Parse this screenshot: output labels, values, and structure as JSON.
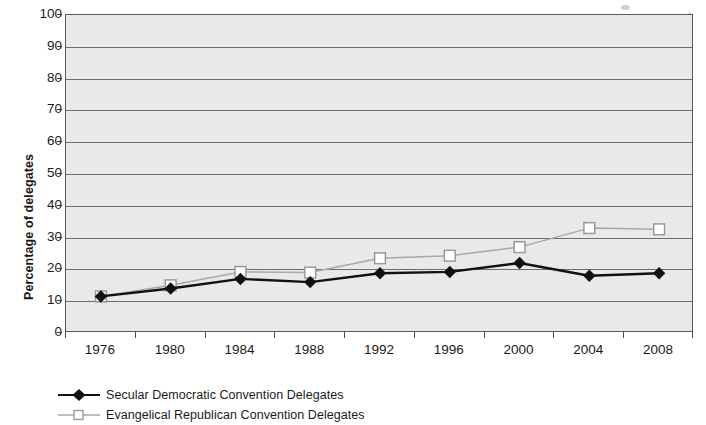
{
  "chart_data": {
    "type": "line",
    "title": "",
    "subtitle": "",
    "xlabel": "",
    "ylabel": "Percentage of delegates",
    "categories": [
      "1976",
      "1980",
      "1984",
      "1988",
      "1992",
      "1996",
      "2000",
      "2004",
      "2008"
    ],
    "ylim": [
      0,
      100
    ],
    "ytick_labels": [
      "0",
      "10",
      "20",
      "30",
      "40",
      "50",
      "60",
      "70",
      "80",
      "90",
      "100"
    ],
    "ytick_values": [
      0,
      10,
      20,
      30,
      40,
      50,
      60,
      70,
      80,
      90,
      100
    ],
    "grid": "horizontal",
    "legend_position": "bottom-left",
    "plot_background": "#e9e9e9",
    "series": [
      {
        "name": "Secular Democratic Convention Delegates",
        "marker": "filled-diamond",
        "color": "#111111",
        "values": [
          11.5,
          14.0,
          17.0,
          16.0,
          18.8,
          19.2,
          22.0,
          18.0,
          18.8
        ]
      },
      {
        "name": "Evangelical Republican Convention Delegates",
        "marker": "open-square",
        "color": "#a8a8a8",
        "values": [
          11.5,
          15.0,
          19.2,
          19.0,
          23.5,
          24.3,
          27.0,
          33.0,
          32.6
        ]
      }
    ]
  },
  "legend": {
    "items": [
      {
        "label": "Secular Democratic Convention Delegates",
        "marker": "filled-diamond"
      },
      {
        "label": "Evangelical Republican Convention Delegates",
        "marker": "open-square"
      }
    ]
  },
  "axis": {
    "y_title": "Percentage of delegates"
  }
}
